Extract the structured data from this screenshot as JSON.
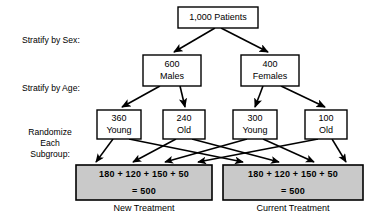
{
  "diagram": {
    "colors": {
      "line": "#000000",
      "box_fill": "#ffffff",
      "group_fill": "#c9c9c9",
      "text": "#000000",
      "background": "#ffffff"
    },
    "stage_labels": {
      "sex": "Stratify by Sex:",
      "age": "Stratify by Age:",
      "randomize_line1": "Randomize",
      "randomize_line2": "Each",
      "randomize_line3": "Subgroup:"
    },
    "root": {
      "label": "1,000 Patients",
      "count": 1000
    },
    "sex_strata": [
      {
        "count": "600",
        "label": "Males"
      },
      {
        "count": "400",
        "label": "Females"
      }
    ],
    "age_strata": [
      {
        "count": "360",
        "label": "Young"
      },
      {
        "count": "240",
        "label": "Old"
      },
      {
        "count": "300",
        "label": "Young"
      },
      {
        "count": "100",
        "label": "Old"
      }
    ],
    "arms": [
      {
        "sum_line": "180 + 120 + 150 + 50",
        "total_line": "= 500",
        "caption": "New Treatment"
      },
      {
        "sum_line": "180 + 120 + 150 + 50",
        "total_line": "= 500",
        "caption": "Current Treatment"
      }
    ]
  }
}
